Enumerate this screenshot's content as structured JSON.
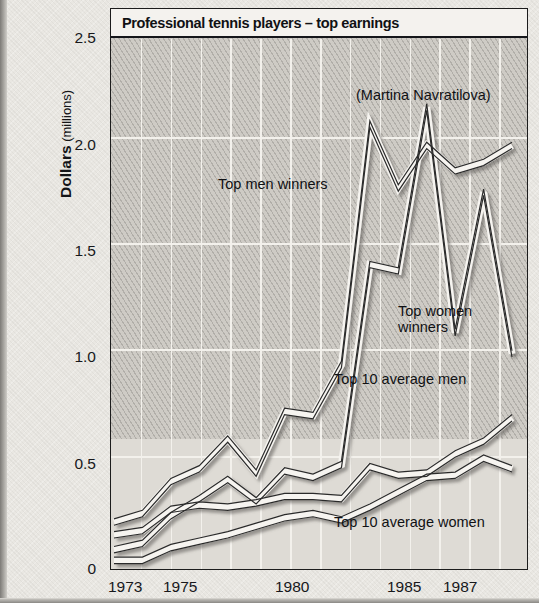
{
  "chart_title": "Professional tennis players – top earnings",
  "axis": {
    "y_title_strong": "Dollars",
    "y_title_light": " (millions)",
    "y_ticks": [
      "0",
      "0.5",
      "1.0",
      "1.5",
      "2.0",
      "2.5"
    ],
    "x_ticks": [
      "1973",
      "1975",
      "1980",
      "1985",
      "1987"
    ]
  },
  "annotations": {
    "navratilova": "(Martina Navratilova)",
    "top_men_winners": "Top men winners",
    "top_women_winners_l1": "Top women",
    "top_women_winners_l2": "winners",
    "top10_avg_men": "Top 10 average men",
    "top10_avg_women": "Top 10 average women"
  },
  "colors": {
    "plot_background": "#cecbc5",
    "grid": "#f3f1ec",
    "line_stroke": "#2b2b2b",
    "line_fill": "#f6f4f0",
    "frame": "#1c1c1c",
    "title_background": "#f4f2ee",
    "page": "#e9e7e2"
  },
  "chart_data": {
    "type": "line",
    "title": "Professional tennis players – top earnings",
    "xlabel": "",
    "ylabel": "Dollars (millions)",
    "xlim": [
      1973,
      1987
    ],
    "ylim": [
      0,
      2.5
    ],
    "grid": true,
    "legend": "inline-annotations",
    "x": [
      1973,
      1974,
      1975,
      1976,
      1977,
      1978,
      1979,
      1980,
      1981,
      1982,
      1983,
      1984,
      1985,
      1986,
      1987
    ],
    "series": [
      {
        "name": "Top men winners",
        "values": [
          0.23,
          0.27,
          0.42,
          0.48,
          0.62,
          0.46,
          0.75,
          0.73,
          0.97,
          2.1,
          1.8,
          2.0,
          1.88,
          1.92,
          2.0
        ]
      },
      {
        "name": "Top women winners",
        "values": [
          0.1,
          0.13,
          0.26,
          0.34,
          0.43,
          0.33,
          0.47,
          0.44,
          0.5,
          1.44,
          1.41,
          2.18,
          1.12,
          1.78,
          1.02
        ]
      },
      {
        "name": "Top 10 average men",
        "values": [
          0.17,
          0.19,
          0.29,
          0.31,
          0.3,
          0.32,
          0.35,
          0.35,
          0.34,
          0.49,
          0.45,
          0.46,
          0.55,
          0.61,
          0.72
        ]
      },
      {
        "name": "Top 10 average women",
        "values": [
          0.05,
          0.05,
          0.11,
          0.14,
          0.17,
          0.21,
          0.25,
          0.27,
          0.24,
          0.3,
          0.37,
          0.44,
          0.45,
          0.53,
          0.48
        ]
      }
    ],
    "annotations": [
      {
        "text": "(Martina Navratilova)",
        "points_to": {
          "x": 1984,
          "y": 2.18
        }
      }
    ]
  }
}
